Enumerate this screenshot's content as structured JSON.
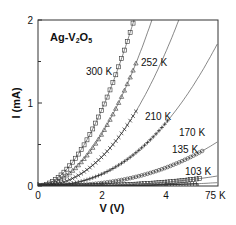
{
  "chart_data": {
    "type": "scatter",
    "title": "Ag-V2O5",
    "title_main": "Ag-V",
    "title_sub1": "2",
    "title_mid": "O",
    "title_sub2": "5",
    "xlabel": "V (V)",
    "ylabel": "I (mA)",
    "xlim": [
      0,
      5.6
    ],
    "ylim": [
      0,
      2
    ],
    "xticks": [
      0,
      2,
      4
    ],
    "yticks": [
      0,
      1,
      2
    ],
    "grid": false,
    "legend_position": "inline labels",
    "series": [
      {
        "name": "300 K",
        "marker": "square",
        "fit_endpoint_v": 3.0,
        "fit_endpoint_i": 2.0,
        "data_max_v": 3.0,
        "exponent": 1.9,
        "points": [
          [
            0.5,
            0.07
          ],
          [
            1.0,
            0.25
          ],
          [
            1.5,
            0.54
          ],
          [
            2.0,
            0.93
          ],
          [
            2.5,
            1.41
          ],
          [
            3.0,
            2.0
          ]
        ]
      },
      {
        "name": "252 K",
        "marker": "triangle",
        "fit_endpoint_v": 3.56,
        "fit_endpoint_i": 2.0,
        "data_max_v": 3.1,
        "exponent": 2.0,
        "points": [
          [
            0.5,
            0.04
          ],
          [
            1.0,
            0.16
          ],
          [
            1.5,
            0.36
          ],
          [
            2.0,
            0.63
          ],
          [
            2.5,
            0.99
          ],
          [
            3.1,
            1.42
          ]
        ]
      },
      {
        "name": "210 K",
        "marker": "x",
        "fit_endpoint_v": 4.4,
        "fit_endpoint_i": 2.0,
        "data_max_v": 3.06,
        "exponent": 2.2,
        "points": [
          [
            0.5,
            0.02
          ],
          [
            1.0,
            0.07
          ],
          [
            1.5,
            0.17
          ],
          [
            2.0,
            0.3
          ],
          [
            2.5,
            0.48
          ],
          [
            3.06,
            0.73
          ]
        ]
      },
      {
        "name": "170 K",
        "marker": "plus",
        "fit_endpoint_v": 5.6,
        "fit_endpoint_i": 1.71,
        "data_max_v": 4.1,
        "exponent": 2.4,
        "points": [
          [
            1.0,
            0.05
          ],
          [
            1.5,
            0.1
          ],
          [
            2.0,
            0.18
          ],
          [
            2.5,
            0.27
          ],
          [
            3.0,
            0.38
          ],
          [
            3.5,
            0.51
          ],
          [
            4.1,
            0.66
          ]
        ]
      },
      {
        "name": "135 K",
        "marker": "circle",
        "fit_endpoint_v": 5.6,
        "fit_endpoint_i": 0.53,
        "data_max_v": 5.15,
        "exponent": 2.6,
        "points": [
          [
            1.0,
            0.01
          ],
          [
            2.0,
            0.05
          ],
          [
            3.0,
            0.13
          ],
          [
            4.0,
            0.25
          ],
          [
            4.5,
            0.33
          ],
          [
            5.15,
            0.42
          ]
        ]
      },
      {
        "name": "103 K",
        "marker": "square",
        "fit_endpoint_v": 5.6,
        "fit_endpoint_i": 0.12,
        "data_max_v": 5.06,
        "exponent": 2.8,
        "points": [
          [
            1.0,
            0.0
          ],
          [
            2.0,
            0.01
          ],
          [
            3.0,
            0.03
          ],
          [
            4.0,
            0.06
          ],
          [
            5.06,
            0.1
          ]
        ]
      },
      {
        "name": "75 K",
        "marker": "plus",
        "fit_endpoint_v": 5.6,
        "fit_endpoint_i": 0.04,
        "data_max_v": 5.0,
        "exponent": 3.0,
        "points": [
          [
            1.0,
            0.0
          ],
          [
            2.0,
            0.0
          ],
          [
            3.0,
            0.01
          ],
          [
            4.0,
            0.02
          ],
          [
            5.0,
            0.03
          ]
        ]
      }
    ],
    "annotations": [
      {
        "text": "300 K",
        "x_px": 86,
        "y_px": 75
      },
      {
        "text": "252 K",
        "x_px": 141,
        "y_px": 66
      },
      {
        "text": "210 K",
        "x_px": 145,
        "y_px": 120
      },
      {
        "text": "170 K",
        "x_px": 179,
        "y_px": 136
      },
      {
        "text": "135 K",
        "x_px": 172,
        "y_px": 153
      },
      {
        "text": "103 K",
        "x_px": 185,
        "y_px": 175
      },
      {
        "text": "75 K",
        "x_px": 205,
        "y_px": 199
      }
    ]
  }
}
